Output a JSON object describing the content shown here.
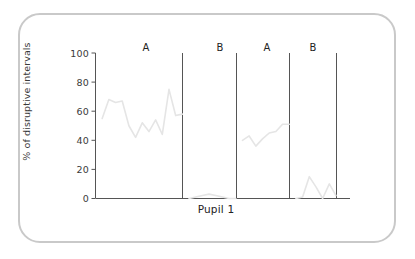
{
  "figure": {
    "frame_color": "#c9c9c9",
    "background": "#ffffff"
  },
  "chart_data": {
    "type": "line",
    "title": "",
    "subtitle": "",
    "xlabel": "Pupil 1",
    "ylabel": "% of disruptive intervals",
    "ylim": [
      0,
      100
    ],
    "yticks": [
      0,
      20,
      40,
      60,
      80,
      100
    ],
    "ytick_labels": [
      "0",
      "20",
      "40",
      "60",
      "80",
      "100"
    ],
    "xlim": [
      0,
      36
    ],
    "grid": false,
    "legend": false,
    "legend_position": "none",
    "line_color": "#e5e5e5",
    "axis_color": "#555555",
    "divider_color": "#555555",
    "design": "ABAB reversal",
    "phases": [
      {
        "label": "A",
        "name": "baseline-1",
        "x_start": 0,
        "x_end": 13,
        "x": [
          1,
          2,
          3,
          4,
          5,
          6,
          7,
          8,
          9,
          10,
          11,
          12,
          13
        ],
        "values": [
          55,
          68,
          66,
          67,
          50,
          42,
          52,
          46,
          54,
          44,
          75,
          57,
          58
        ]
      },
      {
        "label": "B",
        "name": "intervention-1",
        "x_start": 13,
        "x_end": 21,
        "x": [
          14,
          15,
          16,
          17,
          18,
          19,
          20,
          21
        ],
        "values": [
          0,
          1,
          2,
          3,
          2,
          1,
          0,
          0
        ]
      },
      {
        "label": "A",
        "name": "baseline-2",
        "x_start": 21,
        "x_end": 29,
        "x": [
          22,
          23,
          24,
          25,
          26,
          27,
          28,
          29
        ],
        "values": [
          40,
          43,
          36,
          41,
          45,
          46,
          51,
          51
        ]
      },
      {
        "label": "B",
        "name": "intervention-2",
        "x_start": 29,
        "x_end": 36,
        "x": [
          30,
          31,
          32,
          33,
          34,
          35,
          36
        ],
        "values": [
          0,
          1,
          15,
          8,
          0,
          10,
          2
        ]
      }
    ],
    "phase_dividers": [
      13,
      21,
      29,
      36
    ],
    "phase_labels": [
      "A",
      "B",
      "A",
      "B"
    ]
  },
  "axes": {
    "y_title": "% of disruptive intervals",
    "x_title": "Pupil 1",
    "tick_0": "0",
    "tick_20": "20",
    "tick_40": "40",
    "tick_60": "60",
    "tick_80": "80",
    "tick_100": "100"
  },
  "phase_labels": {
    "p0": "A",
    "p1": "B",
    "p2": "A",
    "p3": "B"
  }
}
